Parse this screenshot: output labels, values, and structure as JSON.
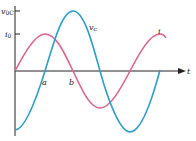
{
  "diagram": {
    "axes": {
      "y_ticks": [
        {
          "label_main": "v",
          "label_sub": "0C",
          "y": 11
        },
        {
          "label_main": "i",
          "label_sub": "0",
          "y": 34
        }
      ],
      "x_axis_label": "t",
      "x_markers": [
        {
          "label": "a",
          "x": 45
        },
        {
          "label": "b",
          "x": 72
        }
      ]
    },
    "curves": [
      {
        "name": "capacitor-voltage",
        "label_main": "v",
        "label_sub": "c",
        "color": "#2a9fd0"
      },
      {
        "name": "current",
        "label_main": "i",
        "color": "#e2628a"
      }
    ],
    "colors": {
      "axis": "#222222",
      "voltage": "#2a9fd0",
      "current": "#e2628a"
    }
  }
}
